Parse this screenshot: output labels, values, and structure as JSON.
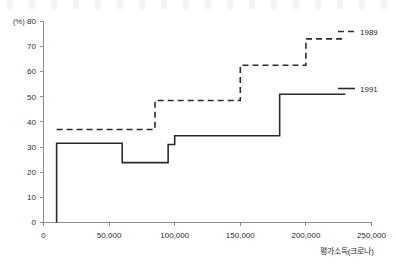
{
  "chart_data": {
    "type": "line",
    "title": "",
    "subtitle": "",
    "xlabel": "평가소득(크로나)",
    "ylabel": "(%)",
    "ylim": [
      0,
      80
    ],
    "xlim": [
      0,
      250000
    ],
    "grid": false,
    "legend_position": "right",
    "y_ticks": [
      0,
      10,
      20,
      30,
      40,
      50,
      60,
      70,
      80
    ],
    "y_tick_labels": [
      "0",
      "10",
      "20",
      "30",
      "40",
      "50",
      "60",
      "70",
      "80"
    ],
    "x_ticks": [
      0,
      50000,
      100000,
      150000,
      200000,
      250000
    ],
    "x_tick_labels": [
      "0",
      "50,000",
      "100,000",
      "150,000",
      "200,000",
      "250,000"
    ],
    "y_axis_unit_label": "(%)",
    "series": [
      {
        "name": "1989",
        "style": "dashed",
        "color": "#2b2b2b",
        "step": "post",
        "points": [
          {
            "x": 10000,
            "y": 37.0
          },
          {
            "x": 85000,
            "y": 37.0
          },
          {
            "x": 85000,
            "y": 48.5
          },
          {
            "x": 150000,
            "y": 48.5
          },
          {
            "x": 150000,
            "y": 62.5
          },
          {
            "x": 200000,
            "y": 62.5
          },
          {
            "x": 200000,
            "y": 73.0
          },
          {
            "x": 230000,
            "y": 73.0
          }
        ]
      },
      {
        "name": "1991",
        "style": "solid",
        "color": "#2b2b2b",
        "step": "post",
        "points": [
          {
            "x": 10000,
            "y": 0.0
          },
          {
            "x": 10000,
            "y": 31.5
          },
          {
            "x": 60000,
            "y": 31.5
          },
          {
            "x": 60000,
            "y": 23.8
          },
          {
            "x": 95000,
            "y": 23.8
          },
          {
            "x": 95000,
            "y": 31.0
          },
          {
            "x": 100000,
            "y": 31.0
          },
          {
            "x": 100000,
            "y": 34.5
          },
          {
            "x": 180000,
            "y": 34.5
          },
          {
            "x": 180000,
            "y": 51.0
          },
          {
            "x": 230000,
            "y": 51.0
          }
        ]
      }
    ],
    "legend": [
      {
        "label": "1989",
        "style": "dashed"
      },
      {
        "label": "1991",
        "style": "solid"
      }
    ]
  }
}
